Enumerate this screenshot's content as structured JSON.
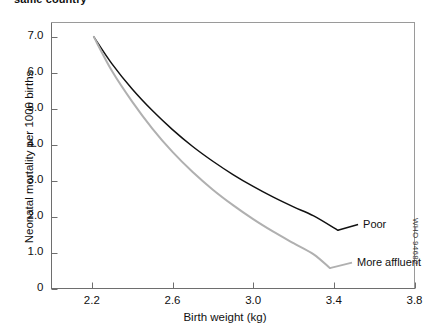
{
  "figure": {
    "clipped_caption": "same country",
    "watermark": "WHO 94682"
  },
  "chart_data": {
    "type": "line",
    "title": "",
    "xlabel": "Birth weight (kg)",
    "ylabel": "Neonatal mortality per 1000 births",
    "xlim": [
      2.0,
      3.8
    ],
    "ylim": [
      0,
      7.4
    ],
    "xticks": [
      2.2,
      2.6,
      3.0,
      3.4,
      3.8
    ],
    "xtick_labels": [
      "2.2",
      "2.6",
      "3.0",
      "3.4",
      "3.8"
    ],
    "yticks": [
      0,
      1.0,
      2.0,
      3.0,
      4.0,
      5.0,
      6.0,
      7.0
    ],
    "ytick_labels": [
      "0",
      "1.0",
      "2.0",
      "3.0",
      "4.0",
      "5.0",
      "6.0",
      "7.0"
    ],
    "grid": false,
    "legend_position": "inline-right-of-curve-ends",
    "series": [
      {
        "name": "Poor",
        "color": "#111111",
        "label_x": 3.53,
        "label_y": 1.78,
        "x": [
          2.21,
          2.3,
          2.4,
          2.5,
          2.6,
          2.7,
          2.8,
          2.9,
          3.0,
          3.1,
          3.2,
          3.3,
          3.42
        ],
        "y": [
          7.0,
          6.25,
          5.55,
          4.95,
          4.42,
          3.95,
          3.54,
          3.17,
          2.84,
          2.54,
          2.27,
          2.02,
          1.62
        ]
      },
      {
        "name": "More affluent",
        "color": "#b0b0b0",
        "label_x": 3.5,
        "label_y": 0.72,
        "x": [
          2.21,
          2.3,
          2.4,
          2.5,
          2.6,
          2.7,
          2.8,
          2.9,
          3.0,
          3.1,
          3.2,
          3.3,
          3.38
        ],
        "y": [
          7.0,
          6.05,
          5.2,
          4.45,
          3.8,
          3.24,
          2.75,
          2.32,
          1.93,
          1.58,
          1.26,
          0.95,
          0.57
        ]
      }
    ]
  }
}
